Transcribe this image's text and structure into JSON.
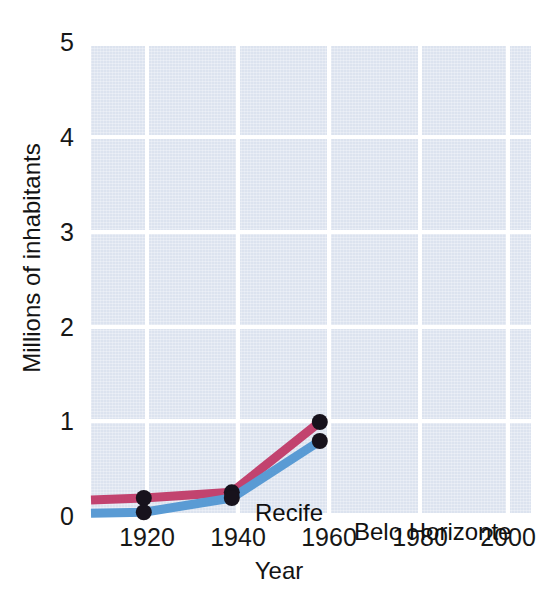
{
  "chart_data": {
    "type": "line",
    "title": "",
    "subtitle": "",
    "xlabel": "Year",
    "ylabel": "Millions of inhabitants",
    "xlim": [
      1908,
      2008
    ],
    "ylim": [
      0,
      5
    ],
    "x_ticks": [
      "1920",
      "1940",
      "1960",
      "1980",
      "2000"
    ],
    "x_tick_values": [
      1920,
      1940,
      1960,
      1980,
      2000
    ],
    "y_ticks": [
      "0",
      "1",
      "2",
      "3",
      "4",
      "5"
    ],
    "y_tick_values": [
      0,
      1,
      2,
      3,
      4,
      5
    ],
    "grid": true,
    "legend_position": "inline-annotation",
    "background_color": "#dce3ef",
    "gridline_color": "#ffffff",
    "marker_color": "#17121c",
    "series": [
      {
        "name": "Recife",
        "color": "#c2436f",
        "x": [
          1908,
          1920,
          1940,
          1960
        ],
        "values": [
          0.18,
          0.2,
          0.26,
          1.0
        ],
        "label": "Recife",
        "label_x": 1925,
        "label_y": 0.52
      },
      {
        "name": "Belo Horizonte",
        "color": "#5a9bd4",
        "x": [
          1908,
          1920,
          1940,
          1960
        ],
        "values": [
          0.04,
          0.05,
          0.2,
          0.8
        ],
        "label": "Belo Horizonte",
        "label_x": 1946,
        "label_y": 0.33
      }
    ],
    "markers": [
      {
        "series": "Recife",
        "x": 1920,
        "y": 0.2
      },
      {
        "series": "Recife",
        "x": 1940,
        "y": 0.26
      },
      {
        "series": "Recife",
        "x": 1960,
        "y": 1.0
      },
      {
        "series": "Belo Horizonte",
        "x": 1920,
        "y": 0.05
      },
      {
        "series": "Belo Horizonte",
        "x": 1940,
        "y": 0.2
      },
      {
        "series": "Belo Horizonte",
        "x": 1960,
        "y": 0.8
      }
    ]
  },
  "axes": {
    "y_title": "Millions of inhabitants",
    "x_title": "Year",
    "y_tick_labels": [
      "5",
      "4",
      "3",
      "2",
      "1",
      "0"
    ],
    "x_tick_labels": [
      "1920",
      "1940",
      "1960",
      "1980",
      "2000"
    ]
  },
  "annotations": {
    "recife_label": "Recife",
    "belo_horizonte_label": "Belo Horizonte"
  }
}
